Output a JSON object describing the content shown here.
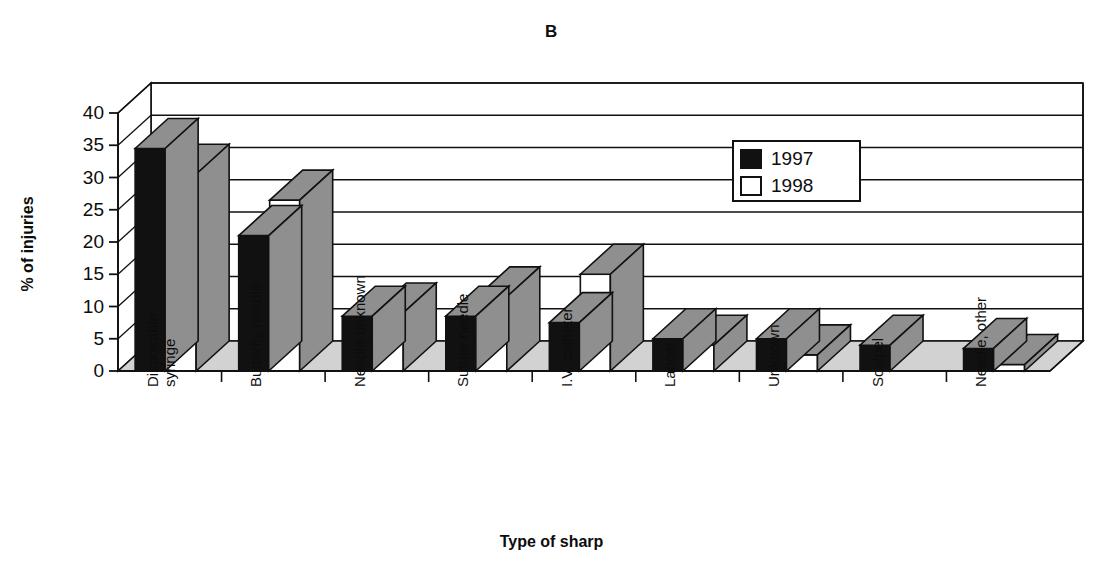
{
  "figure": {
    "panel_letter": "B"
  },
  "chart_data": {
    "type": "bar",
    "title": "B",
    "xlabel": "Type of sharp",
    "ylabel": "% of injuries",
    "ylim": [
      0,
      40
    ],
    "yticks": [
      0,
      5,
      10,
      15,
      20,
      25,
      30,
      35,
      40
    ],
    "grid": true,
    "legend_position": "upper-right",
    "style": "3d-clustered-column",
    "categories": [
      "Disposable syringe",
      "Butterfly needle",
      "Needle unknown",
      "Suture needle",
      "I.V. catheter",
      "Lancet",
      "Unknown",
      "Scalpel",
      "Needle, other"
    ],
    "category_lines": [
      [
        "Disposable",
        "syringe"
      ],
      [
        "Butterfly needle"
      ],
      [
        "Needle unknown"
      ],
      [
        "Suture needle"
      ],
      [
        "I.V. catheter"
      ],
      [
        "Lancet"
      ],
      [
        "Unknown"
      ],
      [
        "Scalpel"
      ],
      [
        "Needle, other"
      ]
    ],
    "series": [
      {
        "name": "1997",
        "color": "#111111",
        "values": [
          34.5,
          21.0,
          8.5,
          8.5,
          7.5,
          5.0,
          5.0,
          4.0,
          3.5
        ]
      },
      {
        "name": "1998",
        "color": "#ffffff",
        "values": [
          30.5,
          26.5,
          9.0,
          11.5,
          15.0,
          4.0,
          2.5,
          0.0,
          1.0
        ]
      }
    ]
  },
  "legend": {
    "items": [
      {
        "label": "1997",
        "swatch": "black"
      },
      {
        "label": "1998",
        "swatch": "white"
      }
    ]
  }
}
